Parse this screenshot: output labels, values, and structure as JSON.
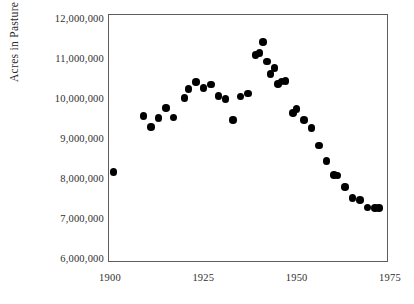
{
  "chart_data": {
    "type": "scatter",
    "title": "",
    "xlabel": "",
    "ylabel": "Acres in Pasture",
    "xlim": [
      1900,
      1975
    ],
    "ylim": [
      6000000,
      12000000
    ],
    "grid": false,
    "legend": "none",
    "marker": {
      "shape": "circle",
      "color": "#000000",
      "size": 7.5
    },
    "xticks": [
      "1900",
      "1925",
      "1950",
      "1975"
    ],
    "xtick_values": [
      1900,
      1925,
      1950,
      1975
    ],
    "yticks": [
      "6,000,000",
      "7,000,000",
      "8,000,000",
      "9,000,000",
      "10,000,000",
      "11,000,000",
      "12,000,000"
    ],
    "ytick_values": [
      6000000,
      7000000,
      8000000,
      9000000,
      10000000,
      11000000,
      12000000
    ],
    "x": [
      1901,
      1909,
      1911,
      1913,
      1915,
      1917,
      1920,
      1921,
      1923,
      1925,
      1927,
      1929,
      1931,
      1933,
      1935,
      1937,
      1939,
      1940,
      1941,
      1942,
      1943,
      1944,
      1945,
      1946,
      1947,
      1949,
      1950,
      1952,
      1954,
      1956,
      1958,
      1960,
      1961,
      1963,
      1965,
      1967,
      1969,
      1971,
      1972
    ],
    "y": [
      8150000,
      9550000,
      9280000,
      9500000,
      9750000,
      9510000,
      10000000,
      10220000,
      10400000,
      10250000,
      10340000,
      10050000,
      9980000,
      9450000,
      10040000,
      10110000,
      11080000,
      11120000,
      11400000,
      10910000,
      10600000,
      10750000,
      10350000,
      10410000,
      10420000,
      9630000,
      9730000,
      9450000,
      9250000,
      8810000,
      8430000,
      8080000,
      8060000,
      7770000,
      7500000,
      7450000,
      7260000,
      7250000,
      7250000
    ],
    "points": [
      {
        "x": 1901,
        "y": 8150000
      },
      {
        "x": 1909,
        "y": 9550000
      },
      {
        "x": 1911,
        "y": 9280000
      },
      {
        "x": 1913,
        "y": 9500000
      },
      {
        "x": 1915,
        "y": 9750000
      },
      {
        "x": 1917,
        "y": 9510000
      },
      {
        "x": 1920,
        "y": 10000000
      },
      {
        "x": 1921,
        "y": 10220000
      },
      {
        "x": 1923,
        "y": 10400000
      },
      {
        "x": 1925,
        "y": 10250000
      },
      {
        "x": 1927,
        "y": 10340000
      },
      {
        "x": 1929,
        "y": 10050000
      },
      {
        "x": 1931,
        "y": 9980000
      },
      {
        "x": 1933,
        "y": 9450000
      },
      {
        "x": 1935,
        "y": 10040000
      },
      {
        "x": 1937,
        "y": 10110000
      },
      {
        "x": 1939,
        "y": 11080000
      },
      {
        "x": 1940,
        "y": 11120000
      },
      {
        "x": 1941,
        "y": 11400000
      },
      {
        "x": 1942,
        "y": 10910000
      },
      {
        "x": 1943,
        "y": 10600000
      },
      {
        "x": 1944,
        "y": 10750000
      },
      {
        "x": 1945,
        "y": 10350000
      },
      {
        "x": 1946,
        "y": 10410000
      },
      {
        "x": 1947,
        "y": 10420000
      },
      {
        "x": 1949,
        "y": 9630000
      },
      {
        "x": 1950,
        "y": 9730000
      },
      {
        "x": 1952,
        "y": 9450000
      },
      {
        "x": 1954,
        "y": 9250000
      },
      {
        "x": 1956,
        "y": 8810000
      },
      {
        "x": 1958,
        "y": 8430000
      },
      {
        "x": 1960,
        "y": 8080000
      },
      {
        "x": 1961,
        "y": 8060000
      },
      {
        "x": 1963,
        "y": 7770000
      },
      {
        "x": 1965,
        "y": 7500000
      },
      {
        "x": 1967,
        "y": 7450000
      },
      {
        "x": 1969,
        "y": 7260000
      },
      {
        "x": 1971,
        "y": 7250000
      },
      {
        "x": 1972,
        "y": 7250000
      }
    ]
  },
  "axes": {
    "frame_color": "#5d5d5d",
    "text_color": "#2f2f2f"
  }
}
